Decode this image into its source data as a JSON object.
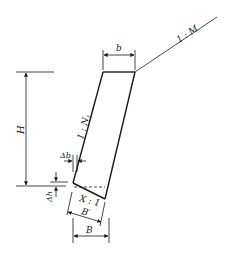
{
  "diagram": {
    "type": "retaining-wall-cross-section",
    "labels": {
      "top_width": "b",
      "backfill_slope": "1 : M",
      "wall_height": "H",
      "face_slope": "1 : N",
      "face_slope_subscript": "1",
      "toe_offset": "Δb",
      "base_drop": "Δh",
      "base_slope": "X : 1",
      "inclined_base_width": "B′",
      "base_width": "B"
    },
    "colors": {
      "line": "#1a1a1a",
      "background": "#ffffff"
    }
  }
}
